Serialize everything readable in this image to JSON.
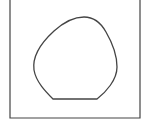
{
  "diagram": {
    "frame": {
      "left": 10,
      "top": -2,
      "right": 140,
      "bottom": 118,
      "stroke": "#444444"
    },
    "shape": {
      "name": "blob-with-flat-base",
      "stroke": "#444444",
      "fill": "#ffffff",
      "path": "M53 99 C46 92 36 82 34 70 C32 56 42 42 54 31 C64 22 74 17 84 17 C94 17 101 23 106 32 C113 44 117 56 117 67 C117 80 106 92 97 99 Z"
    }
  }
}
